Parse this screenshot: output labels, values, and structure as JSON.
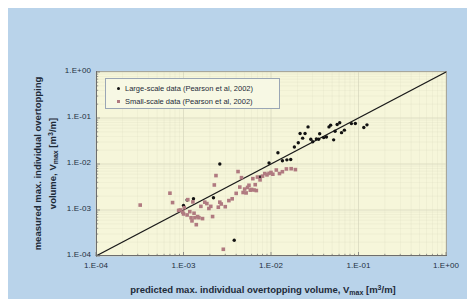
{
  "colors": {
    "panel_background": "#b9d3ea",
    "plot_background": "#f6f6da",
    "large_scale_marker": "#121212",
    "small_scale_marker": "#b07a80",
    "axis_line": "#6d6d6d",
    "gridline": "#d8d8be",
    "trend_line": "#1a1a1a",
    "legend_background": "#f7f8e4",
    "legend_border": "#9aa6b5",
    "text": "#1d2a38"
  },
  "axis_titles": {
    "x_prefix": "predicted max. individual overtopping volume, V",
    "x_sub": "max",
    "x_unit_prefix": " [m",
    "x_unit_sup": "3",
    "x_unit_suffix": "/m]",
    "y_line1": "measured max. individual overtopping",
    "y_line2_prefix": "volume, V",
    "y_sub": "max",
    "y_unit_prefix": " [m",
    "y_unit_sup": "3",
    "y_unit_suffix": "/m]"
  },
  "legend": {
    "items": [
      {
        "label": "Large-scale data (Pearson et al, 2002)",
        "marker": "circle",
        "color": "#121212"
      },
      {
        "label": "Small-scale data (Pearson et al, 2002)",
        "marker": "square",
        "color": "#b07a80"
      }
    ]
  },
  "chart_data": {
    "type": "scatter",
    "title": "",
    "xlabel": "predicted max. individual overtopping volume, Vmax [m3/m]",
    "ylabel": "measured max. individual overtopping volume, Vmax [m3/m]",
    "xscale": "log",
    "yscale": "log",
    "xlim": [
      0.0001,
      1
    ],
    "ylim": [
      0.0001,
      1
    ],
    "grid": true,
    "legend_position": "top-left-inside",
    "xticks": [
      "1.E-04",
      "1.E-03",
      "1.E-02",
      "1.E-01",
      "1.E+00"
    ],
    "xtick_values": [
      0.0001,
      0.001,
      0.01,
      0.1,
      1
    ],
    "yticks": [
      "1.E-04",
      "1.E-03",
      "1.E-02",
      "1.E-01",
      "1.E+00"
    ],
    "ytick_values": [
      0.0001,
      0.001,
      0.01,
      0.1,
      1
    ],
    "reference_line": {
      "label": "1:1 line",
      "from": [
        0.0001,
        0.0001
      ],
      "to": [
        1,
        1
      ]
    },
    "series": [
      {
        "name": "Large-scale data (Pearson et al, 2002)",
        "marker": "circle",
        "color": "#121212",
        "points": [
          [
            0.001,
            0.00125
          ],
          [
            0.0013,
            0.00175
          ],
          [
            0.0011,
            0.00165
          ],
          [
            0.0022,
            0.00185
          ],
          [
            0.0026,
            0.01
          ],
          [
            0.0038,
            0.00022
          ],
          [
            0.0075,
            0.0052
          ],
          [
            0.0095,
            0.0105
          ],
          [
            0.012,
            0.0175
          ],
          [
            0.0135,
            0.0118
          ],
          [
            0.0152,
            0.0123
          ],
          [
            0.0168,
            0.0125
          ],
          [
            0.0185,
            0.0235
          ],
          [
            0.0205,
            0.029
          ],
          [
            0.0215,
            0.046
          ],
          [
            0.023,
            0.0365
          ],
          [
            0.0245,
            0.046
          ],
          [
            0.0265,
            0.064
          ],
          [
            0.0285,
            0.0345
          ],
          [
            0.03,
            0.0305
          ],
          [
            0.033,
            0.0352
          ],
          [
            0.035,
            0.0345
          ],
          [
            0.036,
            0.0455
          ],
          [
            0.04,
            0.0375
          ],
          [
            0.043,
            0.0385
          ],
          [
            0.046,
            0.064
          ],
          [
            0.048,
            0.07
          ],
          [
            0.052,
            0.0335
          ],
          [
            0.054,
            0.0515
          ],
          [
            0.057,
            0.072
          ],
          [
            0.061,
            0.079
          ],
          [
            0.064,
            0.048
          ],
          [
            0.069,
            0.0545
          ],
          [
            0.083,
            0.0755
          ],
          [
            0.092,
            0.076
          ],
          [
            0.115,
            0.062
          ],
          [
            0.125,
            0.071
          ]
        ]
      },
      {
        "name": "Small-scale data (Pearson et al, 2002)",
        "marker": "square",
        "color": "#b07a80",
        "points": [
          [
            0.00032,
            0.00128
          ],
          [
            0.0007,
            0.00232
          ],
          [
            0.00075,
            0.00145
          ],
          [
            0.00088,
            0.00098
          ],
          [
            0.00092,
            0.001
          ],
          [
            0.00098,
            0.0009
          ],
          [
            0.001,
            0.00082
          ],
          [
            0.00102,
            0.00112
          ],
          [
            0.0011,
            0.00078
          ],
          [
            0.00112,
            0.00168
          ],
          [
            0.00118,
            0.00092
          ],
          [
            0.00122,
            0.00068
          ],
          [
            0.00125,
            0.00058
          ],
          [
            0.00128,
            0.0015
          ],
          [
            0.00132,
            0.00085
          ],
          [
            0.00135,
            0.00068
          ],
          [
            0.0014,
            0.00048
          ],
          [
            0.00145,
            0.00072
          ],
          [
            0.0015,
            0.00068
          ],
          [
            0.00158,
            0.0012
          ],
          [
            0.00165,
            0.00065
          ],
          [
            0.00175,
            0.00148
          ],
          [
            0.00185,
            0.00138
          ],
          [
            0.00195,
            0.00108
          ],
          [
            0.00205,
            0.0012
          ],
          [
            0.00215,
            0.00072
          ],
          [
            0.00225,
            0.0035
          ],
          [
            0.00235,
            0.0056
          ],
          [
            0.0025,
            0.00115
          ],
          [
            0.0026,
            0.00148
          ],
          [
            0.0027,
            0.00135
          ],
          [
            0.00285,
            0.00014
          ],
          [
            0.003,
            0.00118
          ],
          [
            0.0033,
            0.0016
          ],
          [
            0.0036,
            0.00175
          ],
          [
            0.004,
            0.0023
          ],
          [
            0.0042,
            0.00685
          ],
          [
            0.0044,
            0.00315
          ],
          [
            0.0046,
            0.00505
          ],
          [
            0.0048,
            0.0024
          ],
          [
            0.005,
            0.00285
          ],
          [
            0.0052,
            0.00235
          ],
          [
            0.0054,
            0.0031
          ],
          [
            0.0056,
            0.00345
          ],
          [
            0.0058,
            0.0027
          ],
          [
            0.006,
            0.0028
          ],
          [
            0.0062,
            0.0048
          ],
          [
            0.0064,
            0.00272
          ],
          [
            0.0066,
            0.00355
          ],
          [
            0.0068,
            0.00265
          ],
          [
            0.007,
            0.0052
          ],
          [
            0.0075,
            0.00452
          ],
          [
            0.008,
            0.00545
          ],
          [
            0.0085,
            0.0062
          ],
          [
            0.009,
            0.0058
          ],
          [
            0.0095,
            0.00625
          ],
          [
            0.01,
            0.00655
          ],
          [
            0.0105,
            0.006
          ],
          [
            0.0115,
            0.0074
          ],
          [
            0.0125,
            0.0062
          ],
          [
            0.0135,
            0.0068
          ],
          [
            0.015,
            0.0078
          ],
          [
            0.017,
            0.0079
          ],
          [
            0.019,
            0.00755
          ]
        ]
      }
    ]
  }
}
